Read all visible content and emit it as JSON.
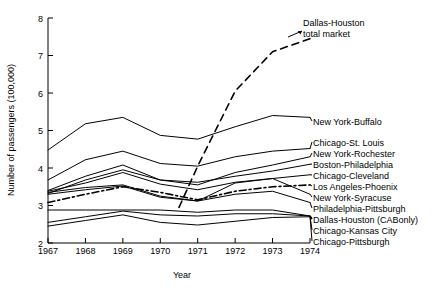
{
  "chart_data": {
    "type": "line",
    "title": "",
    "xlabel": "Year",
    "ylabel": "Number of passengers (100,000)",
    "x": [
      1967,
      1968,
      1969,
      1970,
      1971,
      1972,
      1973,
      1974
    ],
    "xticklabels": [
      "1967",
      "1968",
      "1969",
      "1970",
      "1971",
      "1972",
      "1973",
      "1974"
    ],
    "yticklabels": [
      "2",
      "3",
      "4",
      "5",
      "6",
      "7",
      "8"
    ],
    "ylim": [
      2,
      8
    ],
    "xlim": [
      1967,
      1974
    ],
    "grid": false,
    "legend_position": "right-inline-labels",
    "series": [
      {
        "name": "Dallas-Houston total market",
        "style": "dashed",
        "x": [
          1970.5,
          1971,
          1972,
          1973,
          1974
        ],
        "values": [
          2.95,
          4.05,
          6.05,
          7.1,
          7.45
        ]
      },
      {
        "name": "New York-Buffalo",
        "style": "solid",
        "values": [
          4.48,
          5.18,
          5.35,
          4.87,
          4.77,
          5.1,
          5.4,
          5.35
        ]
      },
      {
        "name": "Chicago-St. Louis",
        "style": "solid",
        "values": [
          3.68,
          4.22,
          4.45,
          4.12,
          4.05,
          4.3,
          4.45,
          4.52
        ]
      },
      {
        "name": "New York-Rochester",
        "style": "solid",
        "values": [
          3.4,
          3.78,
          4.08,
          3.68,
          3.55,
          3.88,
          4.08,
          4.3
        ]
      },
      {
        "name": "Boston-Philadelphia",
        "style": "solid",
        "values": [
          3.32,
          3.68,
          3.95,
          3.68,
          3.62,
          3.78,
          3.92,
          4.1
        ]
      },
      {
        "name": "Chicago-Cleveland",
        "style": "solid",
        "values": [
          3.38,
          3.6,
          3.88,
          3.57,
          3.42,
          3.62,
          3.72,
          3.82
        ]
      },
      {
        "name": "Los Angeles-Phoenix",
        "style": "dash-dot",
        "values": [
          3.08,
          3.3,
          3.5,
          3.35,
          3.15,
          3.38,
          3.5,
          3.55
        ]
      },
      {
        "name": "New York-Syracuse",
        "style": "solid",
        "values": [
          3.35,
          3.48,
          3.55,
          3.25,
          3.12,
          3.6,
          3.72,
          3.3
        ]
      },
      {
        "name": "Philadelphia-Pittsburgh",
        "style": "solid",
        "values": [
          3.3,
          3.42,
          3.52,
          3.22,
          3.12,
          3.3,
          3.38,
          3.08
        ]
      },
      {
        "name": "Dallas-Houston (CAB only)",
        "style": "solid",
        "values": [
          2.88,
          2.88,
          2.88,
          2.88,
          2.82,
          2.88,
          2.88,
          2.72
        ]
      },
      {
        "name": "Chicago-Kansas City",
        "style": "solid",
        "values": [
          2.55,
          2.7,
          2.85,
          2.75,
          2.72,
          2.78,
          2.78,
          2.72
        ]
      },
      {
        "name": "Chicago-Pittsburgh",
        "style": "solid",
        "values": [
          2.45,
          2.6,
          2.75,
          2.55,
          2.48,
          2.58,
          2.68,
          2.7
        ]
      }
    ],
    "annotations": [
      {
        "text_line1": "Dallas-Houston",
        "text_line2": "total market"
      }
    ]
  },
  "labels": {
    "ylabel": "Number of passengers (100,000)",
    "xlabel": "Year",
    "ann_dallas_l1": "Dallas-Houston",
    "ann_dallas_l2": "total market",
    "right": [
      "New York-Buffalo",
      "Chicago-St. Louis",
      "New York-Rochester",
      "Boston-Philadelphia",
      "Chicago-Cleveland",
      "Los Angeles-Phoenix",
      "New York-Syracuse",
      "Philadelphia-Pittsburgh",
      "Dallas-Houston (CABonly)",
      "Chicago-Kansas City",
      "Chicago-Pittsburgh"
    ],
    "xticks": [
      "1967",
      "1968",
      "1969",
      "1970",
      "1971",
      "1972",
      "1973",
      "1974"
    ],
    "yticks": [
      "2",
      "3",
      "4",
      "5",
      "6",
      "7",
      "8"
    ]
  },
  "colors": {
    "ink": "#000000",
    "background": "#ffffff"
  }
}
